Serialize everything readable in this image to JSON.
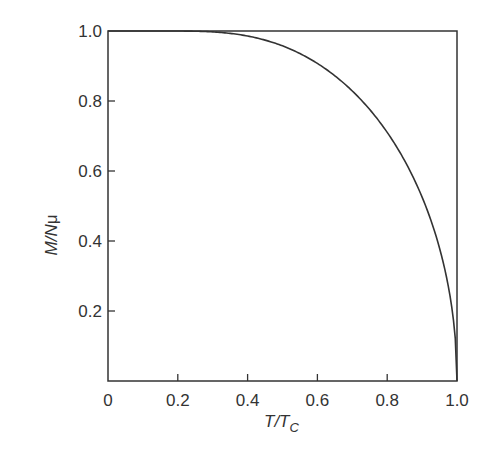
{
  "chart_data": {
    "type": "line",
    "title": "",
    "xlabel": "T/T_C",
    "xlabel_main": "T/T",
    "xlabel_sub": "C",
    "ylabel": "M/Nμ",
    "ylabel_main": "M/N",
    "ylabel_greek": "μ",
    "xlim": [
      0,
      1.0
    ],
    "ylim": [
      0,
      1.0
    ],
    "grid": false,
    "legend": null,
    "x_ticks": [
      "0",
      "0.2",
      "0.4",
      "0.6",
      "0.8",
      "1.0"
    ],
    "y_ticks": [
      "0.2",
      "0.4",
      "0.6",
      "0.8",
      "1.0"
    ],
    "series": [
      {
        "name": "magnetization",
        "x": [
          0,
          0.1,
          0.2,
          0.3,
          0.4,
          0.5,
          0.6,
          0.7,
          0.8,
          0.85,
          0.9,
          0.95,
          0.98,
          1.0
        ],
        "values": [
          1.0,
          0.995,
          0.98,
          0.96,
          0.935,
          0.9,
          0.85,
          0.78,
          0.67,
          0.59,
          0.48,
          0.33,
          0.2,
          0.0
        ]
      }
    ]
  }
}
